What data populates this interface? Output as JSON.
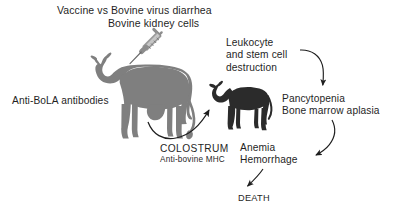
{
  "figure": {
    "background_color": "#ffffff",
    "text_color": "#1f1f1f"
  },
  "labels": {
    "vaccine": "Vaccine vs Bovine virus diarrhea",
    "kidney_cells": "Bovine kidney cells",
    "leukocyte_line1": "Leukocyte",
    "leukocyte_line2": "and stem cell",
    "leukocyte_line3": "destruction",
    "anti_bola": "Anti-BoLA antibodies",
    "pancytopenia_line1": "Pancytopenia",
    "pancytopenia_line2": "Bone marrow aplasia",
    "colostrum": "COLOSTRUM",
    "anti_bovine_mhc": "Anti-bovine MHC",
    "anemia_line1": "Anemia",
    "anemia_line2": "Hemorrhage",
    "death": "DEATH"
  },
  "figures": {
    "cow": {
      "name": "adult-cow-silhouette",
      "color": "#808080",
      "facing": "left"
    },
    "calf": {
      "name": "calf-silhouette",
      "color": "#2b2b2b",
      "facing": "left"
    },
    "syringe": {
      "name": "syringe",
      "color": "#9a9a9a",
      "orientation": "pointing-down-left"
    }
  },
  "arrows": [
    {
      "name": "arrow-leukocyte-to-pancytopenia",
      "from": "and stem cell destruction",
      "to": "Pancytopenia",
      "color": "#1f1f1f"
    },
    {
      "name": "arrow-pancytopenia-to-hemorrhage",
      "from": "Bone marrow aplasia",
      "to": "Hemorrhage",
      "color": "#1f1f1f"
    },
    {
      "name": "arrow-anemia-to-death",
      "from": "Anemia Hemorrhage",
      "to": "DEATH",
      "color": "#1f1f1f"
    },
    {
      "name": "arrow-colostrum-cow-to-calf",
      "from": "COLOSTRUM",
      "to": "calf",
      "color": "#1f1f1f"
    }
  ]
}
